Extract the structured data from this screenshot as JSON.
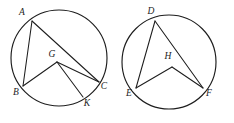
{
  "figure": {
    "canvas": {
      "width": 234,
      "height": 123
    },
    "stroke_color": "#1d1d1d",
    "background_color": "#ffffff"
  },
  "circles": [
    {
      "id": "circle-left",
      "center": {
        "x": 59,
        "y": 58
      },
      "radius": 48,
      "points": [
        {
          "id": "A",
          "label": "A",
          "x": 32,
          "y": 21,
          "label_x": 22,
          "label_y": 13,
          "type": "on-circle"
        },
        {
          "id": "B",
          "label": "B",
          "x": 23,
          "y": 86,
          "label_x": 16,
          "label_y": 93,
          "type": "on-circle"
        },
        {
          "id": "C",
          "label": "C",
          "x": 99,
          "y": 82,
          "label_x": 104,
          "label_y": 87,
          "type": "on-circle"
        },
        {
          "id": "K",
          "label": "K",
          "x": 83,
          "y": 97,
          "label_x": 87,
          "label_y": 104,
          "type": "on-circle"
        },
        {
          "id": "G",
          "label": "G",
          "x": 57,
          "y": 62,
          "label_x": 52,
          "label_y": 55,
          "type": "interior"
        }
      ],
      "segments": [
        {
          "from": "A",
          "to": "B"
        },
        {
          "from": "A",
          "to": "C"
        },
        {
          "from": "B",
          "to": "G"
        },
        {
          "from": "G",
          "to": "C"
        },
        {
          "from": "G",
          "to": "K"
        }
      ]
    },
    {
      "id": "circle-right",
      "center": {
        "x": 169,
        "y": 62
      },
      "radius": 47,
      "points": [
        {
          "id": "D",
          "label": "D",
          "x": 155,
          "y": 21,
          "label_x": 151,
          "label_y": 12,
          "type": "on-circle"
        },
        {
          "id": "E",
          "label": "E",
          "x": 136,
          "y": 88,
          "label_x": 129,
          "label_y": 94,
          "type": "on-circle"
        },
        {
          "id": "F",
          "label": "F",
          "x": 203,
          "y": 88,
          "label_x": 209,
          "label_y": 94,
          "type": "on-circle"
        },
        {
          "id": "H",
          "label": "H",
          "x": 172,
          "y": 67,
          "label_x": 168,
          "label_y": 57,
          "type": "interior"
        }
      ],
      "segments": [
        {
          "from": "D",
          "to": "E"
        },
        {
          "from": "D",
          "to": "F"
        },
        {
          "from": "H",
          "to": "E"
        },
        {
          "from": "H",
          "to": "F"
        }
      ]
    }
  ]
}
